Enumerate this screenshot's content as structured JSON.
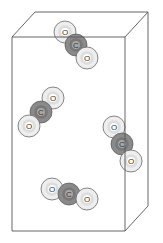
{
  "diagram": {
    "box": {
      "front": {
        "x1": 12,
        "y1": 37,
        "x2": 125,
        "y2": 231
      },
      "depth": {
        "dx": 23,
        "dy": -25
      },
      "stroke": "#555555"
    },
    "colors": {
      "oxygen_fill": "#eeeeee",
      "oxygen_ring": "#cfcfcf",
      "carbon_fill": "#8a8a8a",
      "carbon_ring": "#6a6a6a",
      "outline": "#555555"
    },
    "atom_radius": 11,
    "molecules": [
      {
        "name": "molecule-top",
        "atoms": [
          {
            "el": "O",
            "x": 65,
            "y": 32
          },
          {
            "el": "C",
            "x": 76,
            "y": 45
          },
          {
            "el": "O",
            "x": 87,
            "y": 58
          }
        ]
      },
      {
        "name": "molecule-left",
        "atoms": [
          {
            "el": "O",
            "x": 53,
            "y": 98
          },
          {
            "el": "C",
            "x": 41,
            "y": 112
          },
          {
            "el": "O",
            "x": 29,
            "y": 126
          }
        ]
      },
      {
        "name": "molecule-right",
        "atoms": [
          {
            "el": "O",
            "x": 114,
            "y": 127
          },
          {
            "el": "C",
            "x": 122,
            "y": 144
          },
          {
            "el": "O",
            "x": 131,
            "y": 161
          }
        ]
      },
      {
        "name": "molecule-bottom",
        "atoms": [
          {
            "el": "O",
            "x": 52,
            "y": 189
          },
          {
            "el": "C",
            "x": 69,
            "y": 194
          },
          {
            "el": "O",
            "x": 87,
            "y": 199
          }
        ]
      }
    ],
    "atom_labels": {
      "O": "O",
      "C": "C"
    }
  }
}
